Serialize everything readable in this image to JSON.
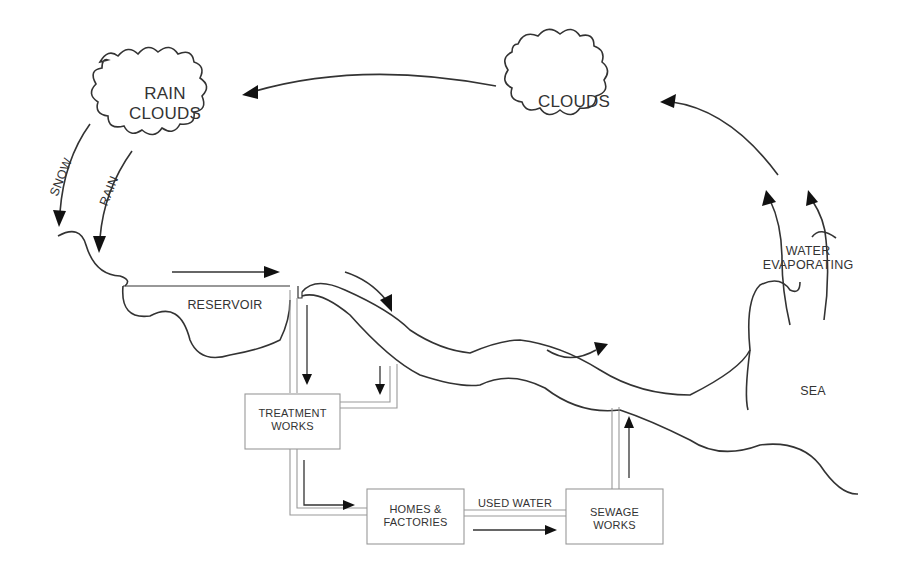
{
  "diagram": {
    "title": "",
    "type": "water cycle / water supply flow diagram",
    "colors": {
      "line": "#333333",
      "pipe": "#999999",
      "background": "#ffffff"
    },
    "nodes": {
      "rain_clouds": {
        "line1": "RAIN",
        "line2": "CLOUDS"
      },
      "clouds": {
        "label": "CLOUDS"
      },
      "reservoir": {
        "label": "RESERVOIR"
      },
      "treatment_works": {
        "line1": "TREATMENT",
        "line2": "WORKS"
      },
      "homes_factories": {
        "line1": "HOMES &",
        "line2": "FACTORIES"
      },
      "sewage_works": {
        "line1": "SEWAGE",
        "line2": "WORKS"
      },
      "sea": {
        "label": "SEA"
      },
      "evaporation": {
        "line1": "WATER",
        "line2": "EVAPORATING"
      }
    },
    "edge_labels": {
      "snow": "SNOW",
      "rain": "RAIN",
      "used_water": "USED WATER"
    },
    "edges": [
      {
        "from": "clouds",
        "to": "rain_clouds"
      },
      {
        "from": "rain_clouds",
        "to": "land",
        "label": "SNOW"
      },
      {
        "from": "rain_clouds",
        "to": "land",
        "label": "RAIN"
      },
      {
        "from": "land",
        "to": "reservoir"
      },
      {
        "from": "reservoir",
        "to": "river"
      },
      {
        "from": "reservoir",
        "to": "treatment_works"
      },
      {
        "from": "river",
        "to": "treatment_works"
      },
      {
        "from": "treatment_works",
        "to": "homes_factories"
      },
      {
        "from": "homes_factories",
        "to": "sewage_works",
        "label": "USED WATER"
      },
      {
        "from": "sewage_works",
        "to": "river"
      },
      {
        "from": "river",
        "to": "sea"
      },
      {
        "from": "sea",
        "to": "clouds",
        "label": "WATER EVAPORATING"
      }
    ]
  }
}
